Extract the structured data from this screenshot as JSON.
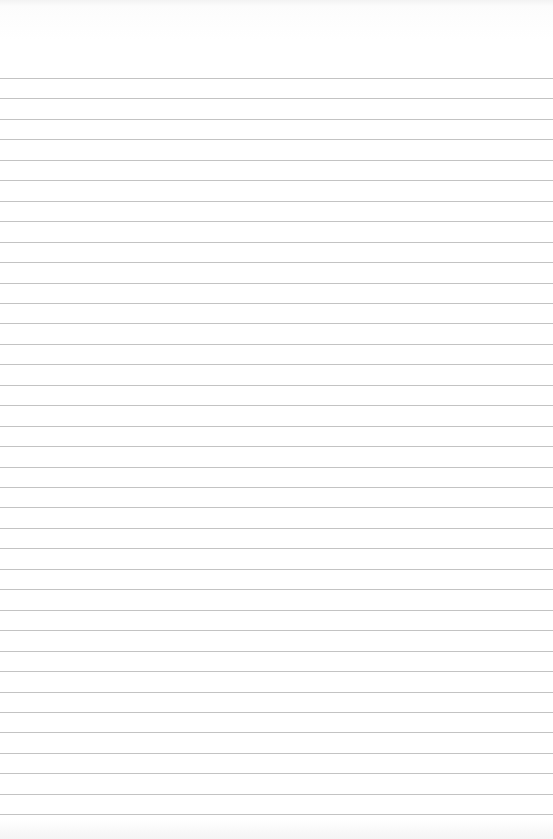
{
  "paper": {
    "type": "lined-paper",
    "background_color": "#ffffff",
    "line_color": "#b9b9b9",
    "first_line_y": 78,
    "line_spacing": 20.45,
    "line_count": 37
  }
}
